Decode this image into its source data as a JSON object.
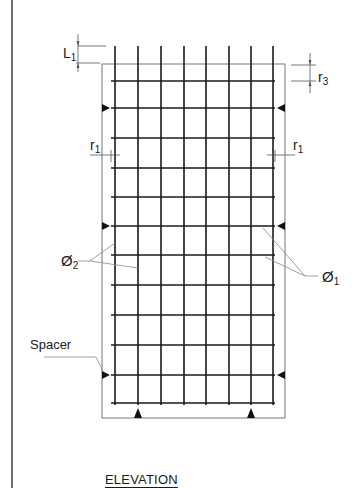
{
  "title": "ELEVATION",
  "labels": {
    "L1": {
      "main": "L",
      "sub": "1"
    },
    "r3": {
      "main": "r",
      "sub": "3"
    },
    "r1_left": {
      "main": "r",
      "sub": "1"
    },
    "r1_right": {
      "main": "r",
      "sub": "1"
    },
    "phi2": {
      "main": "Ø",
      "sub": "2"
    },
    "phi1": {
      "main": "Ø",
      "sub": "1"
    },
    "spacer": "Spacer"
  },
  "geometry": {
    "page_border_x": 12,
    "frame": {
      "left": 102,
      "top": 64,
      "right": 285,
      "bottom": 418
    },
    "vertical_bars_x": [
      115,
      138,
      161,
      184,
      206,
      229,
      251,
      273
    ],
    "vertical_bars_top": 46,
    "vertical_bars_bottom": 405,
    "horizontal_bars_y": [
      81,
      108,
      138,
      168,
      197,
      226,
      255,
      285,
      315,
      345,
      375,
      403
    ],
    "horizontal_bars_x1": 111,
    "horizontal_bars_x2": 275,
    "side_spacer_rows_y": [
      108,
      226,
      375
    ],
    "bottom_spacers_x": [
      138,
      251
    ]
  },
  "colors": {
    "bar": "#1a1a1a",
    "frame": "#777777",
    "leader": "#888888",
    "text": "#1a1a1a"
  }
}
